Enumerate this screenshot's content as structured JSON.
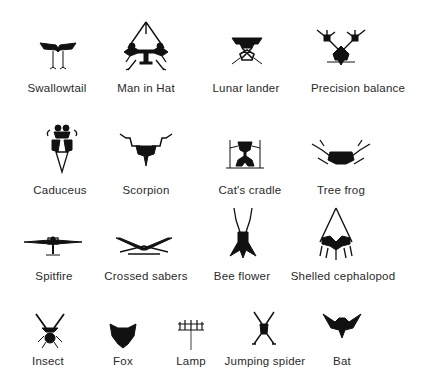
{
  "figure": {
    "rows": [
      {
        "items": [
          {
            "label": "Swallowtail",
            "icon": "swallowtail-biomorph-icon"
          },
          {
            "label": "Man in Hat",
            "icon": "man-in-hat-biomorph-icon"
          },
          {
            "label": "Lunar lander",
            "icon": "lunar-lander-biomorph-icon"
          },
          {
            "label": "Precision balance",
            "icon": "precision-balance-biomorph-icon"
          }
        ]
      },
      {
        "items": [
          {
            "label": "Caduceus",
            "icon": "caduceus-biomorph-icon"
          },
          {
            "label": "Scorpion",
            "icon": "scorpion-biomorph-icon"
          },
          {
            "label": "Cat's cradle",
            "icon": "cats-cradle-biomorph-icon"
          },
          {
            "label": "Tree frog",
            "icon": "tree-frog-biomorph-icon"
          }
        ]
      },
      {
        "items": [
          {
            "label": "Spitfire",
            "icon": "spitfire-biomorph-icon"
          },
          {
            "label": "Crossed sabers",
            "icon": "crossed-sabers-biomorph-icon"
          },
          {
            "label": "Bee flower",
            "icon": "bee-flower-biomorph-icon"
          },
          {
            "label": "Shelled cephalopod",
            "icon": "shelled-cephalopod-biomorph-icon"
          }
        ]
      },
      {
        "items": [
          {
            "label": "Insect",
            "icon": "insect-biomorph-icon"
          },
          {
            "label": "Fox",
            "icon": "fox-biomorph-icon"
          },
          {
            "label": "Lamp",
            "icon": "lamp-biomorph-icon"
          },
          {
            "label": "Jumping spider",
            "icon": "jumping-spider-biomorph-icon"
          },
          {
            "label": "Bat",
            "icon": "bat-biomorph-icon"
          }
        ]
      }
    ],
    "ink_color": "#111111",
    "label_color": "#2a2a2a",
    "background": "#ffffff"
  }
}
